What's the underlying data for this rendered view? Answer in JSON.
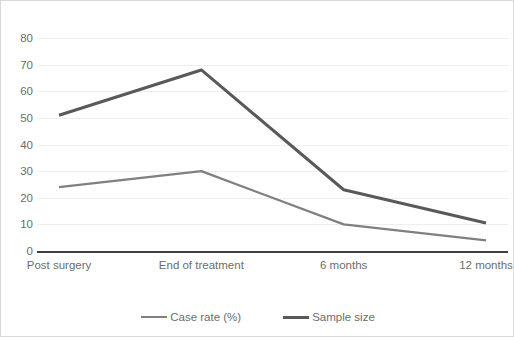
{
  "chart_data": {
    "type": "line",
    "title": "",
    "xlabel": "",
    "ylabel": "",
    "ylim": [
      0,
      80
    ],
    "ytick_step": 10,
    "yticks": [
      "0",
      "10",
      "20",
      "30",
      "40",
      "50",
      "60",
      "70",
      "80"
    ],
    "grid": true,
    "legend_position": "bottom",
    "categories": [
      "Post surgery",
      "End of treatment",
      "6 months",
      "12 months"
    ],
    "series": [
      {
        "name": "Case rate (%)",
        "values": [
          24,
          30,
          10,
          4
        ],
        "color": "#808080",
        "width": 2.2
      },
      {
        "name": "Sample size",
        "values": [
          51,
          68,
          23,
          10.5
        ],
        "color": "#595959",
        "width": 3.0
      }
    ]
  },
  "axes": {
    "gridline_color": "#eceef0",
    "baseline_color": "#3f3f3f",
    "tick_label_color": "#6d6d6d"
  },
  "frame": {
    "border_color": "#d9d9d9",
    "background": "#ffffff"
  }
}
